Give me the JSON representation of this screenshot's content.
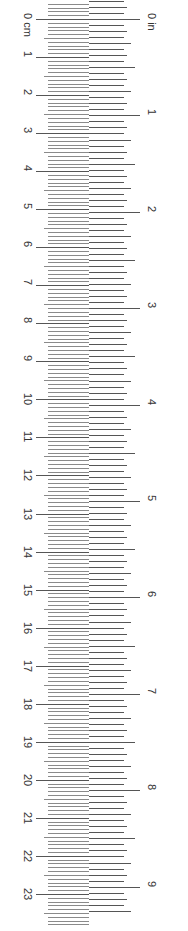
{
  "ruler": {
    "cm": {
      "unit_label": "cm",
      "count": 23,
      "origin_y": 19,
      "px_per_unit": 38.04,
      "labels": [
        "0 cm",
        "1",
        "2",
        "3",
        "4",
        "5",
        "6",
        "7",
        "8",
        "9",
        "10",
        "11",
        "12",
        "13",
        "14",
        "15",
        "16",
        "17",
        "18",
        "19",
        "20",
        "21",
        "22",
        "23"
      ]
    },
    "inch": {
      "unit_label": "in",
      "count": 9,
      "origin_y": 19,
      "px_per_unit": 96.4,
      "labels": [
        "0 in",
        "1",
        "2",
        "3",
        "4",
        "5",
        "6",
        "7",
        "8",
        "9"
      ]
    },
    "colors": {
      "tick": "#555555",
      "minor_tick": "#8a8a8a",
      "text": "#333333",
      "background": "#ffffff"
    }
  }
}
